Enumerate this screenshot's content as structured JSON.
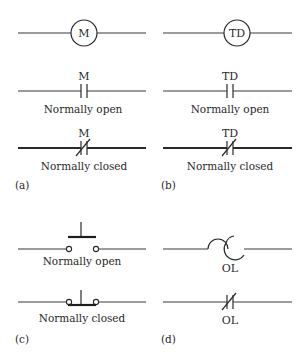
{
  "figure": {
    "panels": [
      {
        "id": "a",
        "label": "(a)",
        "coil": {
          "text": "M"
        },
        "no_contact": {
          "tag": "M",
          "caption": "Normally open"
        },
        "nc_contact": {
          "tag": "M",
          "caption": "Normally closed"
        }
      },
      {
        "id": "b",
        "label": "(b)",
        "coil": {
          "text": "TD"
        },
        "no_contact": {
          "tag": "TD",
          "caption": "Normally open"
        },
        "nc_contact": {
          "tag": "TD",
          "caption": "Normally closed"
        }
      },
      {
        "id": "c",
        "label": "(c)",
        "pushbutton_no": {
          "caption": "Normally open"
        },
        "pushbutton_nc": {
          "caption": "Normally closed"
        }
      },
      {
        "id": "d",
        "label": "(d)",
        "overload_heater": {
          "tag": "OL"
        },
        "overload_contact": {
          "tag": "OL"
        }
      }
    ]
  },
  "colors": {
    "line": "#2a2a2a",
    "background": "#ffffff"
  }
}
